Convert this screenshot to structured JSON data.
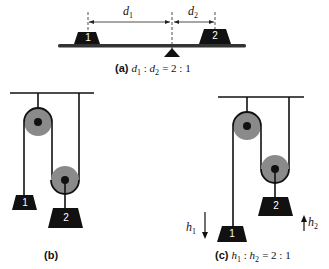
{
  "panel_a": {
    "tag": "(a)",
    "caption_lhs": "d",
    "caption_lhs_sub": "1",
    "caption_mid": "d",
    "caption_mid_sub": "2",
    "caption_ratio": "= 2 : 1",
    "dim_left_label": "d",
    "dim_left_sub": "1",
    "dim_right_label": "d",
    "dim_right_sub": "2",
    "weight_left": "1",
    "weight_right": "2"
  },
  "panel_b": {
    "tag": "(b)",
    "weight_1": "1",
    "weight_2": "2"
  },
  "panel_c": {
    "tag": "(c)",
    "caption_lhs": "h",
    "caption_lhs_sub": "1",
    "caption_mid": "h",
    "caption_mid_sub": "2",
    "caption_ratio": "= 2 : 1",
    "arrow_down_label": "h",
    "arrow_down_sub": "1",
    "arrow_up_label": "h",
    "arrow_up_sub": "2",
    "weight_1": "1",
    "weight_2": "2"
  },
  "colors": {
    "ink": "#111111",
    "pulley": "#8a8a8a",
    "beam": "#333333"
  }
}
